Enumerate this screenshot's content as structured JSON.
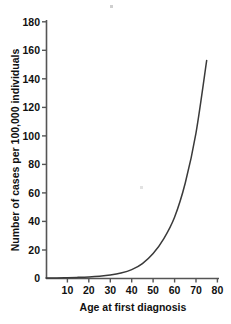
{
  "chart_data": {
    "type": "line",
    "title": "",
    "xlabel": "Age at first diagnosis",
    "ylabel": "Number of cases per 100,000 individuals",
    "xlim": [
      0,
      82
    ],
    "ylim": [
      0,
      180
    ],
    "xticks": [
      10,
      20,
      30,
      40,
      50,
      60,
      70,
      80
    ],
    "yticks": [
      0,
      20,
      40,
      60,
      80,
      100,
      120,
      140,
      160,
      180
    ],
    "grid": false,
    "legend": null,
    "line_color": "#3a3a3a",
    "background_color": "#ffffff",
    "axis_color": "#555555",
    "series": [
      {
        "name": "Incidence",
        "x": [
          0,
          5,
          10,
          15,
          20,
          25,
          30,
          35,
          40,
          45,
          50,
          55,
          60,
          65,
          70,
          75
        ],
        "values": [
          0.3,
          0.4,
          0.6,
          0.8,
          1.1,
          1.6,
          2.4,
          3.8,
          6.2,
          10.5,
          17.5,
          28,
          43,
          67,
          102,
          153
        ]
      }
    ]
  },
  "axes": {
    "y_tick_labels": [
      "180",
      "160",
      "140",
      "120",
      "100",
      "80",
      "60",
      "40",
      "20",
      "0"
    ],
    "x_tick_labels": [
      "10",
      "20",
      "30",
      "40",
      "50",
      "60",
      "70",
      "80"
    ],
    "x_axis_title": "Age at first diagnosis",
    "y_axis_title": "Number of cases per 100,000 individuals"
  }
}
